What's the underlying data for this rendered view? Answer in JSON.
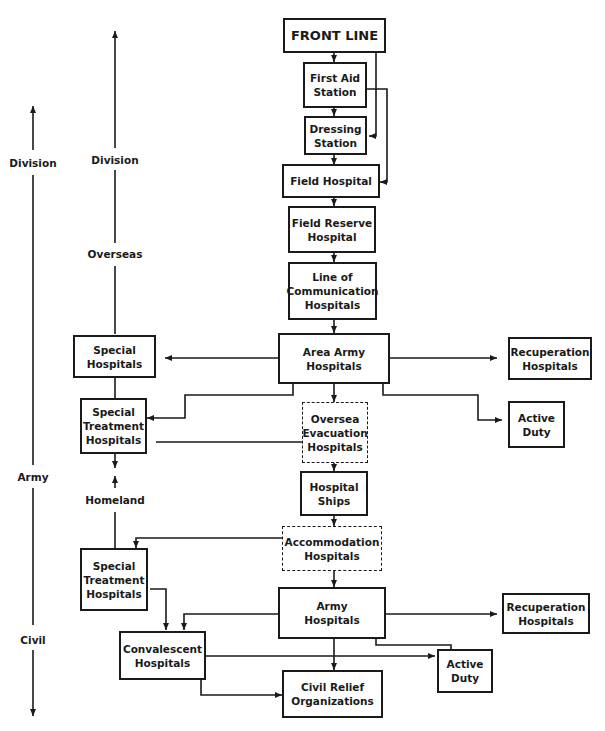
{
  "scale_labels": {
    "outer": {
      "division": "Division",
      "army": "Army",
      "civil": "Civil"
    },
    "inner": {
      "division": "Division",
      "overseas": "Overseas",
      "homeland": "Homeland"
    }
  },
  "nodes": {
    "front_line": "FRONT LINE",
    "first_aid_station": "First Aid\nStation",
    "dressing_station": "Dressing\nStation",
    "field_hospital": "Field Hospital",
    "field_reserve_hospital": "Field Reserve\nHospital",
    "line_of_communication_hospitals": "Line of\nCommunication\nHospitals",
    "area_army_hospitals": "Area Army\nHospitals",
    "special_hospitals": "Special\nHospitals",
    "recuperation_hospitals_overseas": "Recuperation\nHospitals",
    "special_treatment_hospitals_overseas": "Special\nTreatment\nHospitals",
    "oversea_evacuation_hospitals": "Oversea\nEvacuation\nHospitals",
    "active_duty_overseas": "Active\nDuty",
    "hospital_ships": "Hospital\nShips",
    "accommodation_hospitals": "Accommodation\nHospitals",
    "special_treatment_hospitals_homeland": "Special\nTreatment\nHospitals",
    "army_hospitals": "Army\nHospitals",
    "recuperation_hospitals_homeland": "Recuperation\nHospitals",
    "convalescent_hospitals": "Convalescent\nHospitals",
    "active_duty_homeland": "Active\nDuty",
    "civil_relief_organizations": "Civil Relief\nOrganizations"
  },
  "styles": {
    "line_color": "#1a1a1a",
    "background": "#ffffff"
  }
}
